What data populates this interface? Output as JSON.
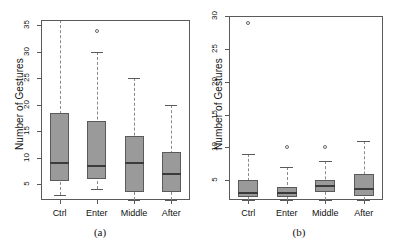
{
  "figure": {
    "width": 399,
    "height": 252,
    "background": "#ffffff",
    "box_fill": "#9a9a9a",
    "box_border": "#5a5a5a",
    "median_color": "#3b3b3b",
    "whisker_color": "#8a8a8a"
  },
  "chart_data": [
    {
      "type": "box",
      "panel_label": "(a)",
      "title": "",
      "xlabel": "",
      "ylabel": "Number of Gestures",
      "categories": [
        "Ctrl",
        "Enter",
        "Middle",
        "After"
      ],
      "ylim": [
        2,
        36
      ],
      "yticks": [
        5,
        10,
        15,
        20,
        25,
        30,
        35
      ],
      "grid": false,
      "legend": "none",
      "boxes": [
        {
          "name": "Ctrl",
          "whisker_low": 3,
          "q1": 5.5,
          "median": 9,
          "q3": 18.5,
          "whisker_high": 36,
          "outliers": []
        },
        {
          "name": "Enter",
          "whisker_low": 4,
          "q1": 6,
          "median": 8.5,
          "q3": 17,
          "whisker_high": 30,
          "outliers": [
            34
          ]
        },
        {
          "name": "Middle",
          "whisker_low": 2,
          "q1": 3.5,
          "median": 9,
          "q3": 14,
          "whisker_high": 25,
          "outliers": []
        },
        {
          "name": "After",
          "whisker_low": 2,
          "q1": 3.5,
          "median": 7,
          "q3": 11,
          "whisker_high": 20,
          "outliers": []
        }
      ]
    },
    {
      "type": "box",
      "panel_label": "(b)",
      "title": "",
      "xlabel": "",
      "ylabel": "Number of Gestures",
      "categories": [
        "Ctrl",
        "Enter",
        "Middle",
        "After"
      ],
      "ylim": [
        2,
        30
      ],
      "yticks": [
        5,
        10,
        15,
        20,
        25,
        30
      ],
      "grid": false,
      "legend": "none",
      "boxes": [
        {
          "name": "Ctrl",
          "whisker_low": 2,
          "q1": 2.5,
          "median": 3,
          "q3": 5.1,
          "whisker_high": 9,
          "outliers": [
            29
          ]
        },
        {
          "name": "Enter",
          "whisker_low": 2,
          "q1": 2.5,
          "median": 3,
          "q3": 4,
          "whisker_high": 7,
          "outliers": [
            10
          ]
        },
        {
          "name": "Middle",
          "whisker_low": 2,
          "q1": 3.2,
          "median": 4.2,
          "q3": 5.1,
          "whisker_high": 8,
          "outliers": [
            10
          ]
        },
        {
          "name": "After",
          "whisker_low": 2,
          "q1": 2.6,
          "median": 3.7,
          "q3": 6,
          "whisker_high": 11,
          "outliers": []
        }
      ]
    }
  ],
  "panels": {
    "a": {
      "caption": "(a)",
      "ylabel": "Number of Gestures",
      "ytick_labels": [
        "5",
        "10",
        "15",
        "20",
        "25",
        "30",
        "35"
      ],
      "xtick_labels": [
        "Ctrl",
        "Enter",
        "Middle",
        "After"
      ]
    },
    "b": {
      "caption": "(b)",
      "ylabel": "Number of Gestures",
      "ytick_labels": [
        "5",
        "10",
        "15",
        "20",
        "25",
        "30"
      ],
      "xtick_labels": [
        "Ctrl",
        "Enter",
        "Middle",
        "After"
      ]
    }
  }
}
